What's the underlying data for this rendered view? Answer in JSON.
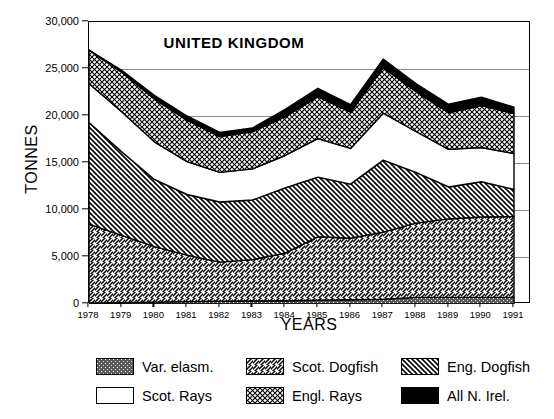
{
  "chart_data": {
    "type": "area",
    "stacked": true,
    "title": "UNITED KINGDOM",
    "xlabel": "YEARS",
    "ylabel": "TONNES",
    "grid": true,
    "legend_position": "bottom",
    "ylim": [
      0,
      30000
    ],
    "yticks": [
      0,
      5000,
      10000,
      15000,
      20000,
      25000,
      30000
    ],
    "ytick_labels": [
      "0",
      "5,000",
      "10,000",
      "15,000",
      "20,000",
      "25,000",
      "30,000"
    ],
    "categories": [
      1978,
      1979,
      1980,
      1981,
      1982,
      1983,
      1984,
      1985,
      1986,
      1987,
      1988,
      1989,
      1990,
      1991
    ],
    "xtick_labels": [
      "1978",
      "1979",
      "1980",
      "1981",
      "1982",
      "1983",
      "1984",
      "1985",
      "1986",
      "1987",
      "1988",
      "1989",
      "1990",
      "1991"
    ],
    "series": [
      {
        "name": "Var. elasm.",
        "pattern": "speckle-dark",
        "color": "#4a4a4a",
        "values": [
          100,
          150,
          200,
          250,
          300,
          320,
          350,
          400,
          450,
          500,
          700,
          700,
          700,
          700
        ]
      },
      {
        "name": "Scot. Dogfish",
        "pattern": "diagonal-forward",
        "color": "#ffffff",
        "values": [
          8400,
          7150,
          5900,
          4950,
          4150,
          4400,
          5050,
          6750,
          6550,
          7150,
          7900,
          8350,
          8550,
          8600
        ]
      },
      {
        "name": "Eng. Dogfish",
        "pattern": "diagonal-back",
        "color": "#ffffff",
        "values": [
          10800,
          8900,
          7150,
          6450,
          6400,
          6350,
          6950,
          6350,
          5750,
          7650,
          5400,
          3400,
          3750,
          2900
        ]
      },
      {
        "name": "Scot. Rays",
        "pattern": "solid-white",
        "color": "#ffffff",
        "values": [
          4150,
          4250,
          4000,
          3500,
          3150,
          3300,
          3450,
          4100,
          3800,
          5000,
          4350,
          4000,
          3650,
          3800
        ]
      },
      {
        "name": "Engl. Rays",
        "pattern": "crosshatch",
        "color": "#ffffff",
        "values": [
          3550,
          4200,
          4550,
          4400,
          3800,
          3950,
          4100,
          4450,
          3850,
          4850,
          4250,
          3900,
          4450,
          4250
        ]
      },
      {
        "name": "All N. Irel.",
        "pattern": "solid-black",
        "color": "#000000",
        "values": [
          0,
          200,
          400,
          450,
          450,
          400,
          800,
          900,
          800,
          900,
          850,
          900,
          900,
          700
        ]
      }
    ],
    "totals": [
      27000,
      24850,
      22200,
      20000,
      18250,
      18720,
      20700,
      22950,
      21200,
      26050,
      23450,
      21250,
      22000,
      20950
    ]
  }
}
